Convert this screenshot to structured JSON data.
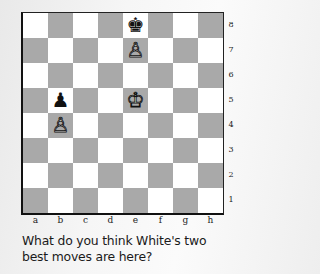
{
  "board": {
    "files": [
      "a",
      "b",
      "c",
      "d",
      "e",
      "f",
      "g",
      "h"
    ],
    "ranks": [
      "8",
      "7",
      "6",
      "5",
      "4",
      "3",
      "2",
      "1"
    ],
    "colors": {
      "light": "#ffffff",
      "dark": "#a9a9a9",
      "border": "#111111"
    },
    "pieces": [
      {
        "square": "e8",
        "color": "black",
        "type": "king",
        "glyph": "♚"
      },
      {
        "square": "e7",
        "color": "white",
        "type": "pawn",
        "glyph": "♙"
      },
      {
        "square": "b5",
        "color": "black",
        "type": "pawn",
        "glyph": "♟"
      },
      {
        "square": "e5",
        "color": "white",
        "type": "king",
        "glyph": "♔"
      },
      {
        "square": "b4",
        "color": "white",
        "type": "pawn",
        "glyph": "♙"
      }
    ]
  },
  "caption": {
    "line1": "What do you think White's two",
    "line2": "best moves are here?"
  }
}
